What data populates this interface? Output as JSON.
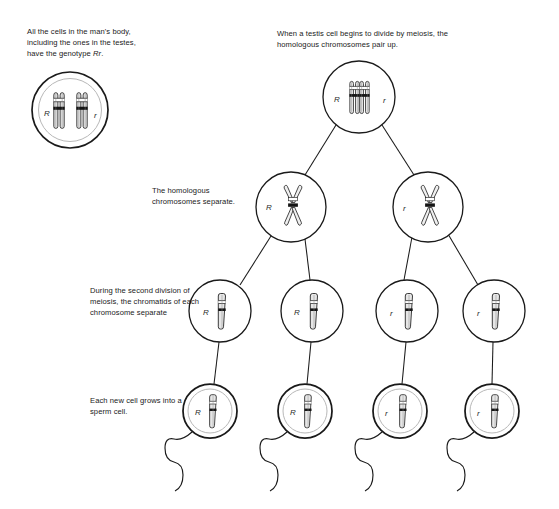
{
  "figure": {
    "type": "biology-process-diagram",
    "background_color": "#ffffff",
    "line_color": "#1a1a1a",
    "text_color": "#1a1a1a"
  },
  "captions": {
    "body_cells": "All the cells in the man's body, including the ones in the testes, have the genotype Rr.",
    "body_cells_line1": "All the cells in the man's body,",
    "body_cells_line2": "including the ones in the testes,",
    "body_cells_line3_plain": "have the genotype ",
    "body_cells_line3_italic": "Rr",
    "body_cells_line3_end": ".",
    "testis_divide": "When a testis cell begins to divide by meiosis, the homologous chromosomes pair up.",
    "homologous_separate": "The homologous chromosomes separate.",
    "second_division": "During the second division of meiosis, the chromatids of each chromosome separate",
    "sperm_cell": "Each new cell grows into a sperm cell."
  },
  "genotype_labels": {
    "dominant": "R",
    "recessive": "r"
  },
  "cells": {
    "row1_body_cell": {
      "stage_name": "body-cell",
      "labels": [
        "R",
        "r"
      ],
      "chromosome_count": 2,
      "chromosome_form": "paired-duplicated-rod",
      "outline": "double-circle",
      "cx": 70,
      "cy": 110,
      "r": 38
    },
    "row2_pairing_cell": {
      "stage_name": "homologous-pair-up",
      "labels": [
        "R",
        "r"
      ],
      "chromosome_count": 2,
      "chromosome_form": "paired-bivalent-rods",
      "outline": "single-circle",
      "cx": 359,
      "cy": 97,
      "r": 36
    },
    "row3_cells": [
      {
        "stage_name": "after-first-division-left",
        "label": "R",
        "chromosome_form": "x-shaped",
        "cx": 291,
        "cy": 207,
        "r": 35
      },
      {
        "stage_name": "after-first-division-right",
        "label": "r",
        "chromosome_form": "x-shaped",
        "cx": 428,
        "cy": 207,
        "r": 35
      }
    ],
    "row4_cells": [
      {
        "stage_name": "after-second-division-1",
        "label": "R",
        "chromosome_form": "single-rod",
        "cx": 220,
        "cy": 311,
        "r": 31
      },
      {
        "stage_name": "after-second-division-2",
        "label": "R",
        "chromosome_form": "single-rod",
        "cx": 312,
        "cy": 311,
        "r": 31
      },
      {
        "stage_name": "after-second-division-3",
        "label": "r",
        "chromosome_form": "single-rod",
        "cx": 407,
        "cy": 311,
        "r": 31
      },
      {
        "stage_name": "after-second-division-4",
        "label": "r",
        "chromosome_form": "single-rod",
        "cx": 494,
        "cy": 311,
        "r": 31
      }
    ],
    "row5_sperm": [
      {
        "stage_name": "sperm-cell-1",
        "label": "R",
        "chromosome_form": "single-rod",
        "outline": "double-circle",
        "cx": 210,
        "cy": 411,
        "r": 27
      },
      {
        "stage_name": "sperm-cell-2",
        "label": "R",
        "chromosome_form": "single-rod",
        "outline": "double-circle",
        "cx": 305,
        "cy": 411,
        "r": 27
      },
      {
        "stage_name": "sperm-cell-3",
        "label": "r",
        "chromosome_form": "single-rod",
        "outline": "double-circle",
        "cx": 400,
        "cy": 411,
        "r": 27
      },
      {
        "stage_name": "sperm-cell-4",
        "label": "r",
        "chromosome_form": "single-rod",
        "outline": "double-circle",
        "cx": 492,
        "cy": 411,
        "r": 27
      }
    ]
  },
  "summary_genotype_ratio": {
    "R": 2,
    "r": 2,
    "ratio_text": "2 R : 2 r"
  }
}
